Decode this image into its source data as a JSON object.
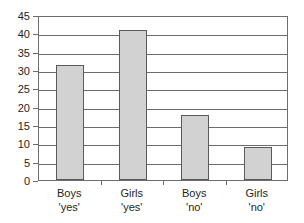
{
  "chart_data": {
    "type": "bar",
    "title": "",
    "subtitle": "",
    "xlabel": "",
    "ylabel": "",
    "categories": [
      "Boys 'yes'",
      "Girls 'yes'",
      "Boys 'no'",
      "Girls 'no'"
    ],
    "category_lines": [
      [
        "Boys",
        "'yes'"
      ],
      [
        "Girls",
        "'yes'"
      ],
      [
        "Boys",
        "'no'"
      ],
      [
        "Girls",
        "'no'"
      ]
    ],
    "values": [
      31.5,
      41,
      17.8,
      9
    ],
    "ylim": [
      0,
      45
    ],
    "ytick_labels": [
      "45",
      "40",
      "35",
      "30",
      "25",
      "20",
      "15",
      "10",
      "5",
      "0"
    ],
    "ytick_values": [
      45,
      40,
      35,
      30,
      25,
      20,
      15,
      10,
      5,
      0
    ],
    "ytick_step": 5,
    "grid": true,
    "grid_axis": "y",
    "legend": false,
    "legend_position": "none",
    "bar_fill_color": "#d2d2d2",
    "bar_border_color": "#5a5a5a",
    "axis_color": "#6c6c6c",
    "text_color": "#231f20",
    "background_color": "#ffffff"
  }
}
